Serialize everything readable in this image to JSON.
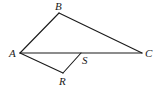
{
  "diagram": {
    "type": "geometry-figure",
    "stroke_color": "#1a1a1a",
    "background": "#ffffff",
    "points": {
      "A": {
        "label": "A",
        "x": 20,
        "y": 53
      },
      "B": {
        "label": "B",
        "x": 59,
        "y": 13
      },
      "C": {
        "label": "C",
        "x": 142,
        "y": 53
      },
      "S": {
        "label": "S",
        "x": 81,
        "y": 53
      },
      "R": {
        "label": "R",
        "x": 63,
        "y": 73
      }
    },
    "segments": [
      [
        "A",
        "B"
      ],
      [
        "B",
        "C"
      ],
      [
        "A",
        "C"
      ],
      [
        "A",
        "R"
      ],
      [
        "R",
        "S"
      ]
    ],
    "labels": {
      "A": "A",
      "B": "B",
      "C": "C",
      "S": "S",
      "R": "R"
    }
  }
}
